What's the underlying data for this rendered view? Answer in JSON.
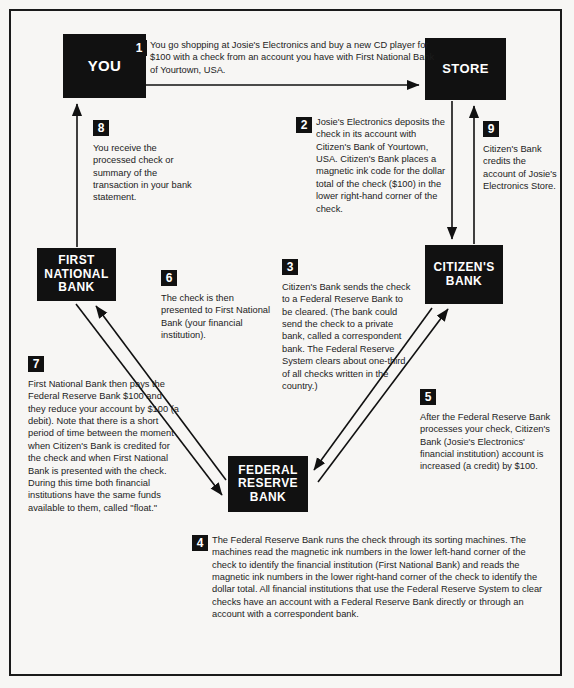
{
  "diagram": {
    "ink_color": "#111111",
    "page_color": "#f7f6f4"
  },
  "nodes": [
    {
      "id": "you",
      "label": "YOU"
    },
    {
      "id": "store",
      "label": "STORE"
    },
    {
      "id": "fnb",
      "label": "FIRST\nNATIONAL\nBANK"
    },
    {
      "id": "citizens",
      "label": "CITIZEN'S\nBANK"
    },
    {
      "id": "frb",
      "label": "FEDERAL\nRESERVE\nBANK"
    }
  ],
  "steps": [
    {
      "number": "1",
      "text": "You go shopping at Josie's Electronics and buy a new CD player for $100 with a check from an account you have with First National Bank of Yourtown, USA."
    },
    {
      "number": "2",
      "text": "Josie's Electronics deposits the check in its account with Citizen's Bank of Yourtown, USA. Citizen's Bank places a magnetic ink code for the dollar total of the check ($100) in the lower right-hand corner of the check."
    },
    {
      "number": "3",
      "text": "Citizen's Bank sends the check to a Federal Reserve Bank to be cleared. (The bank could send the check to a private bank, called a correspondent bank. The Federal Reserve System clears about one-third of all checks written in the country.)"
    },
    {
      "number": "4",
      "text": "The Federal Reserve Bank runs the check through its sorting machines. The machines read the magnetic ink numbers in the lower left-hand corner of the check to identify the financial institution (First National Bank) and reads the magnetic ink numbers in the lower right-hand corner of the check to identify the dollar total. All financial institutions that use the Federal Reserve System to clear checks have an account with a Federal Reserve Bank directly or through an account with a correspondent bank."
    },
    {
      "number": "5",
      "text": "After the Federal Reserve Bank processes your check, Citizen's Bank (Josie's Electronics' financial institution) account is increased (a credit) by $100."
    },
    {
      "number": "6",
      "text": "The check is then presented to First National Bank (your financial institution)."
    },
    {
      "number": "7",
      "text": "First National Bank then pays the Federal Reserve Bank $100 and they reduce your account by $100 (a debit). Note that there is a short period of time between the moment when Citizen's Bank is credited for the check and when First National Bank is presented with the check. During this time both financial institutions have the same funds available to them, called \"float.\""
    },
    {
      "number": "8",
      "text": "You receive the processed check or summary of the transaction in your bank statement."
    },
    {
      "number": "9",
      "text": "Citizen's Bank credits the account of Josie's Electronics Store."
    }
  ],
  "flows": [
    {
      "id": "flow-you-to-store",
      "from": "you",
      "to": "store",
      "step": "1"
    },
    {
      "id": "flow-store-to-citizens",
      "from": "store",
      "to": "citizens",
      "step": "2"
    },
    {
      "id": "flow-citizens-to-frb",
      "from": "citizens",
      "to": "frb",
      "step": "3"
    },
    {
      "id": "flow-frb-to-citizens",
      "from": "frb",
      "to": "citizens",
      "step": "5"
    },
    {
      "id": "flow-frb-to-fnb",
      "from": "frb",
      "to": "fnb",
      "step": "6"
    },
    {
      "id": "flow-fnb-to-frb",
      "from": "fnb",
      "to": "frb",
      "step": "7"
    },
    {
      "id": "flow-fnb-to-you",
      "from": "fnb",
      "to": "you",
      "step": "8"
    },
    {
      "id": "flow-citizens-to-store",
      "from": "citizens",
      "to": "store",
      "step": "9"
    }
  ]
}
